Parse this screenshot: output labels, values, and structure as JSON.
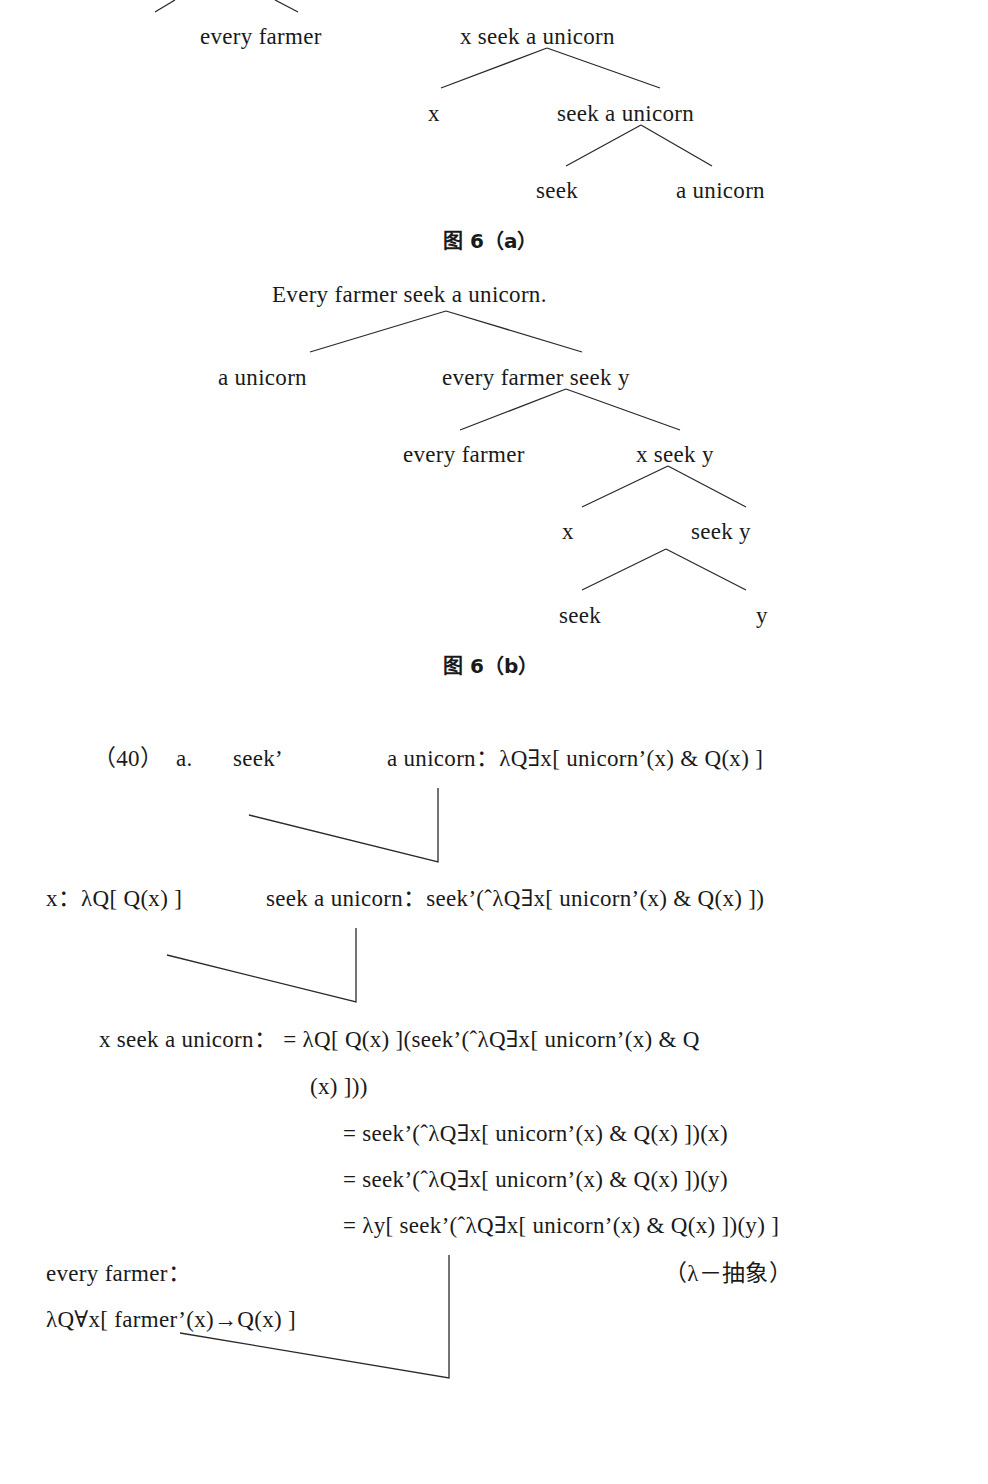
{
  "figure_6a": {
    "nodes": {
      "every_farmer": "every farmer",
      "x_seek_a_unicorn": "x seek a unicorn",
      "x": "x",
      "seek_a_unicorn": "seek a unicorn",
      "seek": "seek",
      "a_unicorn": "a unicorn"
    },
    "caption": "图 6（a）"
  },
  "figure_6b": {
    "nodes": {
      "root": "Every farmer seek a unicorn.",
      "a_unicorn": "a unicorn",
      "every_farmer_seek_y": "every farmer seek y",
      "every_farmer": "every farmer",
      "x_seek_y": "x seek y",
      "x": "x",
      "seek_y": "seek y",
      "seek": "seek",
      "y": "y"
    },
    "caption": "图 6（b）"
  },
  "example_40": {
    "number": "（40）",
    "label": "a.",
    "seek_prime": "seek’",
    "a_unicorn_formula": "a unicorn：λQ∃x[ unicorn’(x) & Q(x) ]",
    "x_formula": "x：λQ[ Q(x) ]",
    "seek_a_unicorn_formula": "seek a unicorn：seek’(ˆλQ∃x[ unicorn’(x) & Q(x) ])",
    "derivation": {
      "line1": "x seek a unicorn： = λQ[ Q(x) ](seek’(ˆλQ∃x[ unicorn’(x) & Q",
      "line1_cont": "(x) ]))",
      "line2": "= seek’(ˆλQ∃x[ unicorn’(x) & Q(x) ])(x)",
      "line3": "= seek’(ˆλQ∃x[ unicorn’(x) & Q(x) ])(y)",
      "line4": "= λy[ seek’(ˆλQ∃x[ unicorn’(x) & Q(x) ])(y) ]"
    },
    "annotation": "（λ－抽象）",
    "every_farmer_label": "every farmer：",
    "every_farmer_formula": "λQ∀x[ farmer’(x)→Q(x) ]"
  }
}
